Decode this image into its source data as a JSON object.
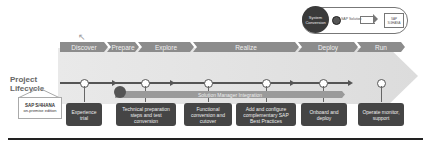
{
  "phases": [
    {
      "label": "Discover"
    },
    {
      "label": "Prepare"
    },
    {
      "label": "Explore"
    },
    {
      "label": "Realize"
    },
    {
      "label": "Deploy"
    },
    {
      "label": "Run"
    }
  ],
  "legend": {
    "circle_label": "System Conversion",
    "dot_label": "SAP Solution",
    "house_label": "SAP S/4HANA"
  },
  "lifecycle_label": "Project Lifecycle",
  "product": {
    "name": "SAP S/4HANA",
    "edition": "on-premise edition"
  },
  "integration_bar": {
    "label": "Solution Manager Integration"
  },
  "tasks": [
    {
      "label": "Experience trial"
    },
    {
      "label": "Technical preparation steps and test conversion"
    },
    {
      "label": "Functional conversion and cutover"
    },
    {
      "label": "Add and configure complementary SAP Best Practices"
    },
    {
      "label": "Onboard and deploy"
    },
    {
      "label": "Operate monitor, support"
    }
  ],
  "colors": {
    "phase_bar": "#8c8c8c",
    "task_box": "#454545",
    "band": "#e2e2e2",
    "line": "#555555"
  }
}
